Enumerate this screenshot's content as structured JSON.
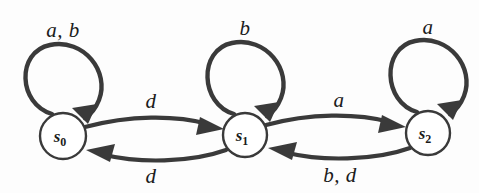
{
  "diagram": {
    "type": "finite-state-machine",
    "background_color": "#fdfdfd",
    "stroke_color": "#3a3a3a",
    "node_fill": "#ffffff",
    "states": [
      {
        "id": "s0",
        "label_base": "s",
        "label_sub": "0",
        "cx": 63,
        "cy": 136,
        "r": 23
      },
      {
        "id": "s1",
        "label_base": "s",
        "label_sub": "1",
        "cx": 245,
        "cy": 135,
        "r": 22
      },
      {
        "id": "s2",
        "label_base": "s",
        "label_sub": "2",
        "cx": 428,
        "cy": 133,
        "r": 22
      }
    ],
    "self_loops": [
      {
        "id": "loop-s0",
        "state": "s0",
        "label": "a, b",
        "label_x": 63,
        "label_y": 30
      },
      {
        "id": "loop-s1",
        "state": "s1",
        "label": "b",
        "label_x": 245,
        "label_y": 28
      },
      {
        "id": "loop-s2",
        "state": "s2",
        "label": "a",
        "label_x": 428,
        "label_y": 27
      }
    ],
    "transitions": [
      {
        "id": "s0-to-s1",
        "from": "s0",
        "to": "s1",
        "label": "d",
        "label_x": 151,
        "label_y": 101
      },
      {
        "id": "s1-to-s0",
        "from": "s1",
        "to": "s0",
        "label": "d",
        "label_x": 151,
        "label_y": 176
      },
      {
        "id": "s1-to-s2",
        "from": "s1",
        "to": "s2",
        "label": "a",
        "label_x": 339,
        "label_y": 100
      },
      {
        "id": "s2-to-s1",
        "from": "s2",
        "to": "s1",
        "label": "b, d",
        "label_x": 340,
        "label_y": 175
      }
    ]
  }
}
